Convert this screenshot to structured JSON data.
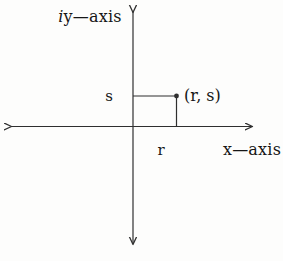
{
  "diagram": {
    "type": "cartesian-axes-complex-plane",
    "labels": {
      "y_axis_prefix": "i",
      "y_axis_rest": "y—axis",
      "x_axis": "x—axis",
      "ordinate": "s",
      "abscissa": "r",
      "point": "(r, s)"
    },
    "point_symbolic": {
      "x": "r",
      "y": "s"
    },
    "colors": {
      "line": "#2f2f2f",
      "text": "#161616",
      "background": "#fdfdfc"
    }
  }
}
